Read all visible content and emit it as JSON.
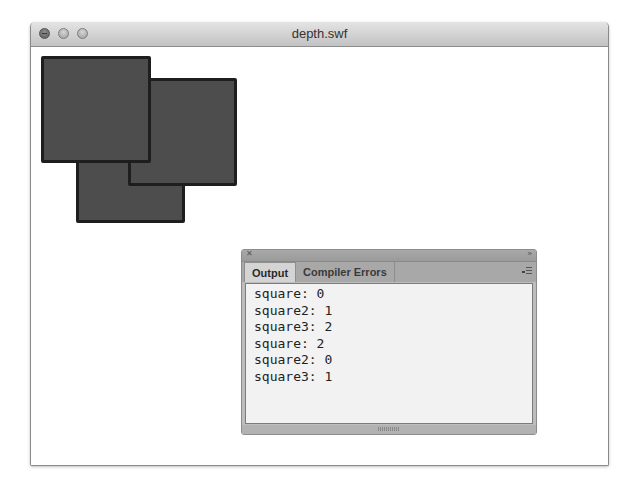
{
  "window": {
    "title": "depth.swf",
    "controls": [
      "close",
      "minimize",
      "zoom"
    ]
  },
  "stage": {
    "background": "#ffffff",
    "squares": [
      {
        "name": "square",
        "x": 10,
        "y": 9,
        "w": 110,
        "h": 107,
        "fill": "#4d4d4d",
        "stroke": "#1e1e1e",
        "z": 2
      },
      {
        "name": "square2",
        "x": 97,
        "y": 31,
        "w": 109,
        "h": 108,
        "fill": "#4d4d4d",
        "stroke": "#1e1e1e",
        "z": 1
      },
      {
        "name": "square3",
        "x": 45,
        "y": 66,
        "w": 109,
        "h": 110,
        "fill": "#4d4d4d",
        "stroke": "#1e1e1e",
        "z": 0
      }
    ]
  },
  "panel": {
    "tabs": [
      {
        "label": "Output",
        "active": true
      },
      {
        "label": "Compiler Errors",
        "active": false
      }
    ],
    "output_lines": [
      "square: 0",
      "square2: 1",
      "square3: 2",
      "square: 2",
      "square2: 0",
      "square3: 1"
    ]
  }
}
